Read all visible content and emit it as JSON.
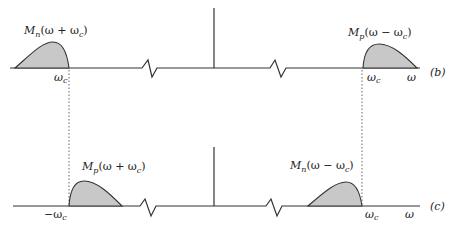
{
  "diagram": {
    "panels": [
      {
        "id": "b",
        "tag": "(b)",
        "left_label": {
          "base": "M",
          "sub": "n",
          "arg": "(ω + ω",
          "argsub": "c",
          "close": ")"
        },
        "right_label": {
          "base": "M",
          "sub": "p",
          "arg": "(ω − ω",
          "argsub": "c",
          "close": ")"
        },
        "axis_tick_labels": {
          "left_wc": "ω",
          "left_wc_sub": "c",
          "right_wc": "ω",
          "right_wc_sub": "c",
          "omega": "ω"
        }
      },
      {
        "id": "c",
        "tag": "(c)",
        "left_label": {
          "base": "M",
          "sub": "p",
          "arg": "(ω + ω",
          "argsub": "c",
          "close": ")"
        },
        "right_label": {
          "base": "M",
          "sub": "n",
          "arg": "(ω − ω",
          "argsub": "c",
          "close": ")"
        },
        "axis_tick_labels": {
          "neg_wc": "−ω",
          "neg_wc_sub": "c",
          "right_wc": "ω",
          "right_wc_sub": "c",
          "omega": "ω"
        }
      }
    ],
    "colors": {
      "line": "#333333",
      "fill": "#c8c8c8",
      "dotted": "#666666"
    }
  }
}
